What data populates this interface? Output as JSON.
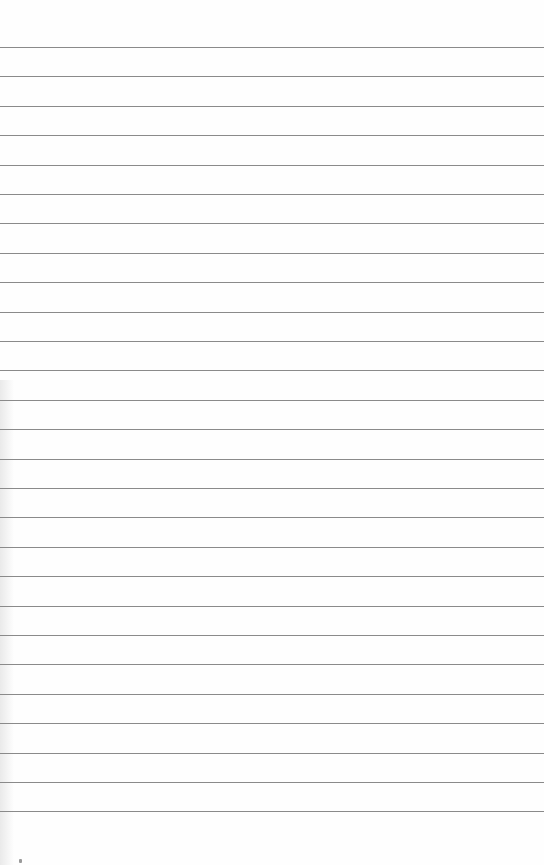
{
  "page": {
    "type": "ruled-paper",
    "background_color": "#fefefe",
    "rule_color": "#8a8a8a",
    "rule_count": 27,
    "first_rule_y": 47,
    "rule_spacing": 29.4
  }
}
